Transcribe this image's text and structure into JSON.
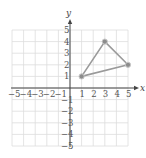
{
  "chart_data": {
    "type": "scatter",
    "title": "",
    "xlabel": "x",
    "ylabel": "y",
    "xlim": [
      -5,
      5
    ],
    "ylim": [
      -5,
      5
    ],
    "grid": true,
    "legend": null,
    "x_ticks": [
      "-5",
      "-4",
      "-3",
      "-2",
      "-1",
      "1",
      "2",
      "3",
      "4",
      "5"
    ],
    "y_ticks": [
      "5",
      "4",
      "3",
      "2",
      "1",
      "-1",
      "-2",
      "-3",
      "-4",
      "-5"
    ],
    "series": [
      {
        "name": "triangle",
        "closed_polygon": true,
        "points": [
          {
            "x": 1,
            "y": 1
          },
          {
            "x": 3,
            "y": 4
          },
          {
            "x": 5,
            "y": 2
          }
        ]
      }
    ]
  },
  "colors": {
    "grid": "#dddddd",
    "axis": "#444444",
    "polygon_line": "#9a9a9a",
    "vertex_fill": "#8c8c8c",
    "vertex_stroke": "#c8c8c8"
  },
  "axes": {
    "x_label": "x",
    "y_label": "y"
  }
}
